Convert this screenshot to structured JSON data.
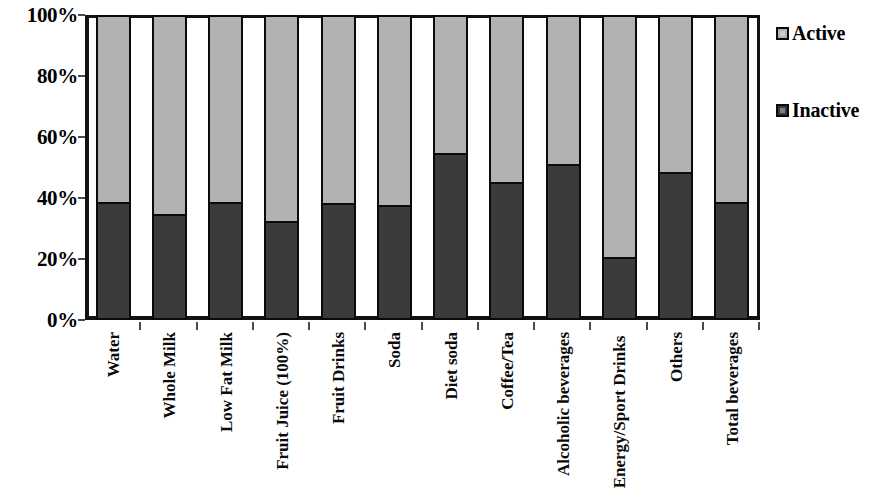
{
  "chart_data": {
    "type": "bar",
    "subtype": "stacked-100-percent",
    "title": "",
    "xlabel": "",
    "ylabel": "",
    "ylim": [
      0,
      100
    ],
    "y_unit": "%",
    "grid": false,
    "legend_position": "right",
    "categories": [
      "Water",
      "Whole Milk",
      "Low Fat Milk",
      "Fruit Juice (100%)",
      "Fruit Drinks",
      "Soda",
      "Diet soda",
      "Coffee/Tea",
      "Alcoholic beverages",
      "Energy/Sport Drinks",
      "Others",
      "Total beverages"
    ],
    "y_ticks": [
      "0%",
      "20%",
      "40%",
      "60%",
      "80%",
      "100%"
    ],
    "y_tick_values": [
      0,
      20,
      40,
      60,
      80,
      100
    ],
    "series": [
      {
        "name": "Inactive",
        "color": "#3b3b3b",
        "stack_position": "bottom",
        "values": [
          38,
          34,
          38,
          31.5,
          37.5,
          37,
          54,
          44.5,
          50.5,
          19.5,
          48,
          38
        ]
      },
      {
        "name": "Active",
        "color": "#b2b2b2",
        "stack_position": "top",
        "values": [
          62,
          66,
          62,
          68.5,
          62.5,
          63,
          46,
          55.5,
          49.5,
          80.5,
          52,
          62
        ]
      }
    ]
  },
  "legend": {
    "items": [
      {
        "label": "Active",
        "color": "#b2b2b2"
      },
      {
        "label": "Inactive",
        "color": "#3b3b3b"
      }
    ]
  },
  "x_axis_labels": [
    {
      "text": "Water",
      "lines": 1
    },
    {
      "text": "Whole Milk",
      "lines": 1
    },
    {
      "text": "Low Fat Milk",
      "lines": 1
    },
    {
      "text": "Fruit Juice (100%)",
      "lines": 1
    },
    {
      "text": "Fruit Drinks",
      "lines": 1
    },
    {
      "text": "Soda",
      "lines": 1
    },
    {
      "text": "Diet soda",
      "lines": 1
    },
    {
      "text": "Coffee/Tea",
      "lines": 1
    },
    {
      "text": "Alcoholic beverages",
      "lines": 1
    },
    {
      "text": "Energy/Sport Drinks",
      "lines": 2
    },
    {
      "text": "Others",
      "lines": 1
    },
    {
      "text": "Total beverages",
      "lines": 1
    }
  ]
}
